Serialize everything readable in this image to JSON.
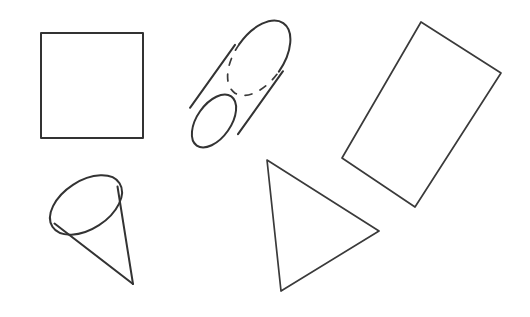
{
  "scene": {
    "title": "Geometric Shapes Line Drawing",
    "background_color": "#ffffff",
    "stroke_color": "#333333",
    "width": 530,
    "height": 317,
    "style": "hand-drawn black outline, no fill"
  },
  "shapes": [
    {
      "id": "square",
      "name": "square",
      "label": "Square",
      "type": "polygon",
      "stroke_color": "#333333",
      "stroke_width": 2,
      "fill": "none",
      "points": "41,33 143,33 143,138 41,138",
      "position": "top-left",
      "rotation_deg": 0
    },
    {
      "id": "cylinder",
      "name": "cylinder",
      "label": "Cylinder",
      "type": "cylinder-3d",
      "stroke_color": "#333333",
      "stroke_width": 2,
      "fill": "none",
      "position": "top-center",
      "rotation_deg": -55,
      "has_hidden_dashed_edge": true,
      "near_ellipse": {
        "cx": 214,
        "cy": 121,
        "rx": 30,
        "ry": 17,
        "rotation_deg": -55
      },
      "far_ellipse": {
        "cx": 259,
        "cy": 58,
        "rx": 30,
        "ry": 17,
        "rotation_deg": -55
      },
      "side_a": "200,98 245,35",
      "side_b": "229,145 274,82"
    },
    {
      "id": "rectangle",
      "name": "rectangle",
      "label": "Rectangle",
      "type": "polygon",
      "stroke_color": "#333333",
      "stroke_width": 2,
      "fill": "none",
      "points": "421,22 501,73 415,207 342,158",
      "position": "right",
      "rotation_deg": -32
    },
    {
      "id": "cone",
      "name": "cone",
      "label": "Cone",
      "type": "cone-3d",
      "stroke_color": "#333333",
      "stroke_width": 2,
      "fill": "none",
      "position": "bottom-left",
      "rotation_deg": -35,
      "base_ellipse": {
        "cx": 86,
        "cy": 205,
        "rx": 40,
        "ry": 24,
        "rotation_deg": -33
      },
      "apex": {
        "x": 133,
        "y": 284
      }
    },
    {
      "id": "triangle",
      "name": "triangle",
      "label": "Triangle",
      "type": "polygon",
      "stroke_color": "#333333",
      "stroke_width": 2,
      "fill": "none",
      "points": "267,160 379,231 281,291",
      "position": "bottom-center",
      "rotation_deg": 0
    }
  ]
}
